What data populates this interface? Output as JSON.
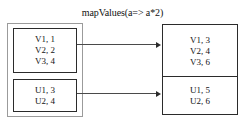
{
  "diagram": {
    "title": "mapValues(a=> a*2)",
    "operation_name": "mapValues",
    "operation_expression": "a=> a*2",
    "colors": {
      "box_border": "#2b2b2b",
      "container_border": "#9b9b9b",
      "arrow": "#4a4a4a",
      "background": "#ffffff",
      "text": "#141414"
    },
    "input": {
      "partitions": [
        {
          "name": "input-partition-1",
          "entries": [
            "V1, 1",
            "V2, 2",
            "V3, 4"
          ]
        },
        {
          "name": "input-partition-2",
          "entries": [
            "U1, 3",
            "U2, 4"
          ]
        }
      ]
    },
    "output": {
      "partitions": [
        {
          "name": "output-partition-1",
          "entries": [
            "V1, 3",
            "V2, 4",
            "V3, 6"
          ]
        },
        {
          "name": "output-partition-2",
          "entries": [
            "U1, 5",
            "U2, 6"
          ]
        }
      ]
    },
    "arrows": [
      {
        "name": "arrow-partition-1",
        "label": ""
      },
      {
        "name": "arrow-partition-2",
        "label": ""
      }
    ]
  }
}
